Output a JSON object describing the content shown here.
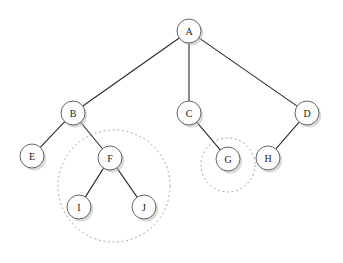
{
  "diagram": {
    "background_color": "#ffffff",
    "node_fill": "#fdfdfd",
    "node_stroke": "#555555",
    "edge_color": "#2b2b2b",
    "group_stroke": "#9a9a9a",
    "node_radius": 12,
    "nodes": [
      {
        "id": "A",
        "label": "A",
        "cx": 189,
        "cy": 31
      },
      {
        "id": "B",
        "label": "B",
        "cx": 73,
        "cy": 113
      },
      {
        "id": "C",
        "label": "C",
        "cx": 189,
        "cy": 113
      },
      {
        "id": "D",
        "label": "D",
        "cx": 307,
        "cy": 113
      },
      {
        "id": "E",
        "label": "E",
        "cx": 32,
        "cy": 156
      },
      {
        "id": "F",
        "label": "F",
        "cx": 110,
        "cy": 158
      },
      {
        "id": "G",
        "label": "G",
        "cx": 228,
        "cy": 159
      },
      {
        "id": "H",
        "label": "H",
        "cx": 268,
        "cy": 158
      },
      {
        "id": "I",
        "label": "I",
        "cx": 79,
        "cy": 207
      },
      {
        "id": "J",
        "label": "J",
        "cx": 144,
        "cy": 207
      }
    ],
    "edges": [
      {
        "from": "A",
        "to": "B"
      },
      {
        "from": "A",
        "to": "C"
      },
      {
        "from": "A",
        "to": "D"
      },
      {
        "from": "B",
        "to": "E"
      },
      {
        "from": "B",
        "to": "F"
      },
      {
        "from": "C",
        "to": "G"
      },
      {
        "from": "D",
        "to": "H"
      },
      {
        "from": "F",
        "to": "I"
      },
      {
        "from": "F",
        "to": "J"
      }
    ],
    "groups": [
      {
        "id": "group-f",
        "label": "F subtree highlight",
        "cx": 114,
        "cy": 186,
        "r": 56,
        "members": [
          "F",
          "I",
          "J"
        ]
      },
      {
        "id": "group-g",
        "label": "G highlight",
        "cx": 228,
        "cy": 165,
        "r": 27,
        "members": [
          "G"
        ]
      }
    ]
  }
}
